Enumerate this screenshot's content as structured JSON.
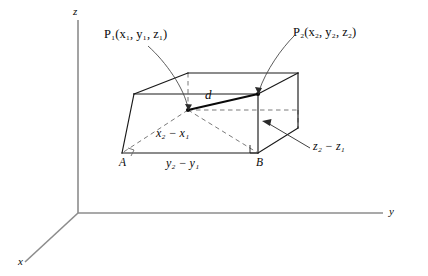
{
  "figure": {
    "type": "geometry-diagram",
    "axes": {
      "z_label": "z",
      "y_label": "y",
      "x_label": "x",
      "origin": [
        78,
        213
      ]
    },
    "labels": {
      "p1": "P₁(x₁, y₁, z₁)",
      "p2": "P₂(x₂, y₂, z₂)",
      "distance": "d",
      "vertex_a": "A",
      "vertex_b": "B",
      "dx": "x₂ − x₁",
      "dy": "y₂ − y₁",
      "dz": "z₂ − z₁"
    },
    "colors": {
      "axis": "#8c8c8c",
      "solid_line": "#1a1a1a",
      "dashed_line": "#6b6b6b",
      "leader_line": "#6b6b6b",
      "text": "#0a0a0a",
      "background": "#ffffff"
    },
    "geometry": {
      "box_front_top_left": [
        134,
        94
      ],
      "box_front_top_right": [
        258,
        94
      ],
      "box_front_bottom_left": [
        122,
        153
      ],
      "box_front_bottom_right": [
        258,
        153
      ],
      "box_back_top_left": [
        188,
        73
      ],
      "box_back_top_right": [
        298,
        73
      ],
      "box_back_bottom_right": [
        298,
        128
      ],
      "point_p1": [
        188,
        110
      ],
      "point_p2": [
        258,
        94
      ]
    }
  }
}
